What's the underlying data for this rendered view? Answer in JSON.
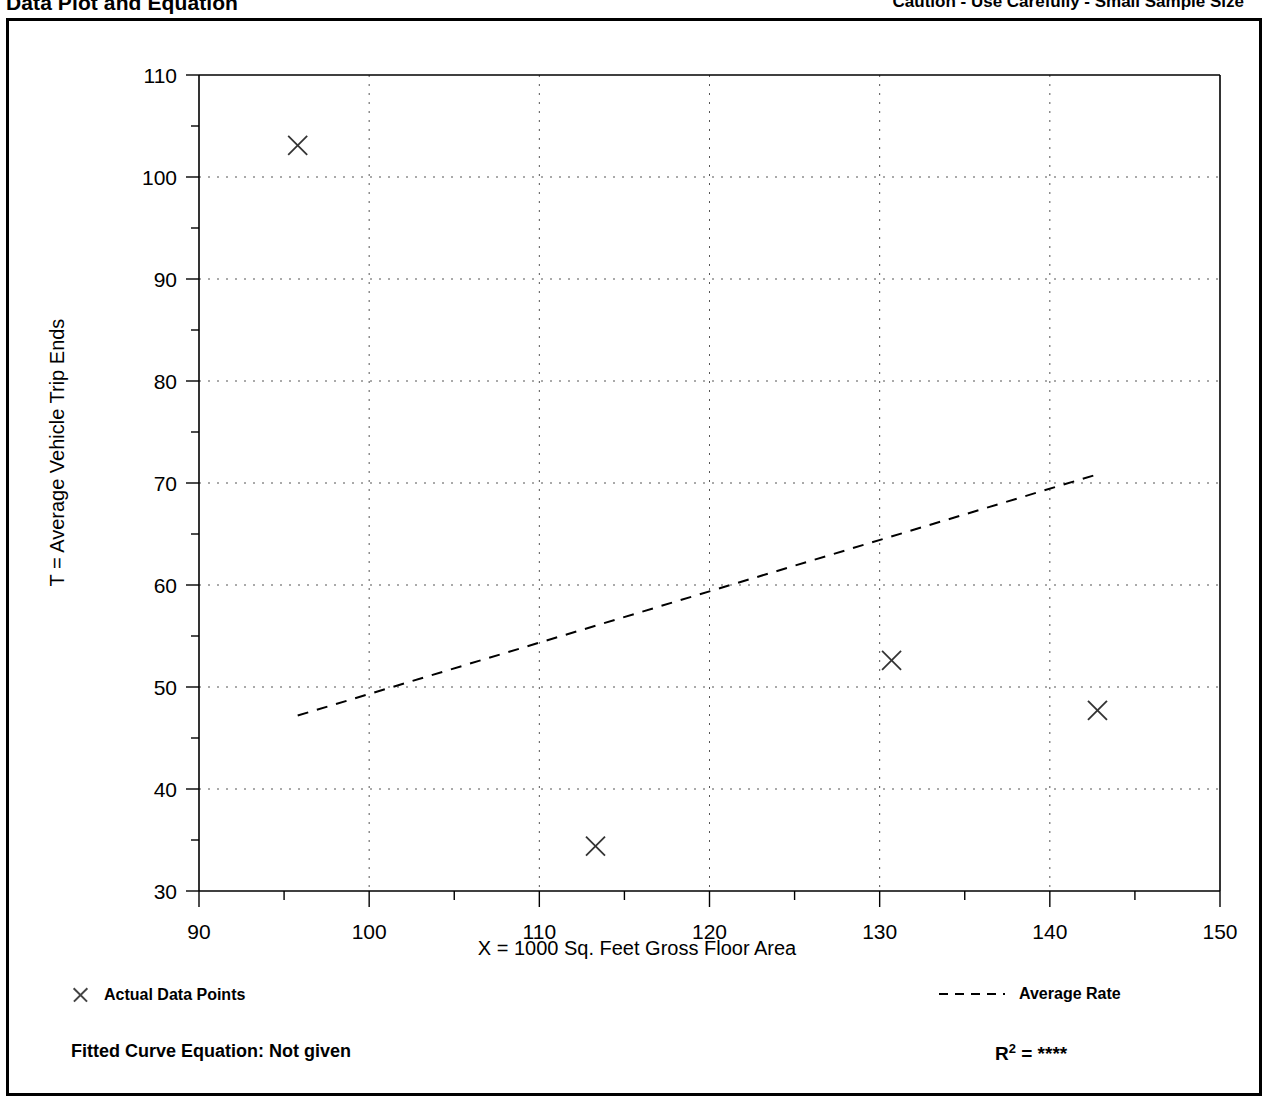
{
  "header": {
    "title": "Data Plot and Equation",
    "caution": "Caution - Use Carefully - Small Sample Size"
  },
  "legend": {
    "data_points_label": "Actual Data Points",
    "average_rate_label": "Average Rate",
    "marker_icon": "x-marker-icon",
    "line_icon": "dashed-line-icon"
  },
  "footer": {
    "equation_label": "Fitted Curve Equation:  Not given",
    "r_squared_prefix": "R",
    "r_squared_exponent": "2",
    "r_squared_value": "= ****"
  },
  "chart_data": {
    "type": "scatter",
    "title": "Data Plot and Equation",
    "xlabel": "X = 1000 Sq. Feet Gross Floor Area",
    "ylabel": "T = Average Vehicle Trip Ends",
    "xlim": [
      90,
      150
    ],
    "ylim": [
      30,
      110
    ],
    "xticks": [
      90,
      100,
      110,
      120,
      130,
      140,
      150
    ],
    "xtick_labels": [
      "90",
      "100",
      "110",
      "120",
      "130",
      "140",
      "150"
    ],
    "xminor_step": 5,
    "yticks": [
      30,
      40,
      50,
      60,
      70,
      80,
      90,
      100,
      110
    ],
    "ytick_labels": [
      "30",
      "40",
      "50",
      "60",
      "70",
      "80",
      "90",
      "100",
      "110"
    ],
    "yminor_step": 5,
    "grid": true,
    "grid_style": "dotted",
    "legend_position": "below-plot",
    "series": [
      {
        "name": "Actual Data Points",
        "type": "scatter",
        "marker": "x",
        "points": [
          {
            "x": 95.8,
            "y": 103.1
          },
          {
            "x": 113.3,
            "y": 34.4
          },
          {
            "x": 130.7,
            "y": 52.6
          },
          {
            "x": 142.8,
            "y": 47.7
          }
        ]
      },
      {
        "name": "Average Rate",
        "type": "line",
        "style": "dashed",
        "points": [
          {
            "x": 95.8,
            "y": 47.2
          },
          {
            "x": 142.7,
            "y": 70.8
          }
        ]
      }
    ],
    "fitted_curve_equation": "Not given",
    "r_squared": "****"
  }
}
